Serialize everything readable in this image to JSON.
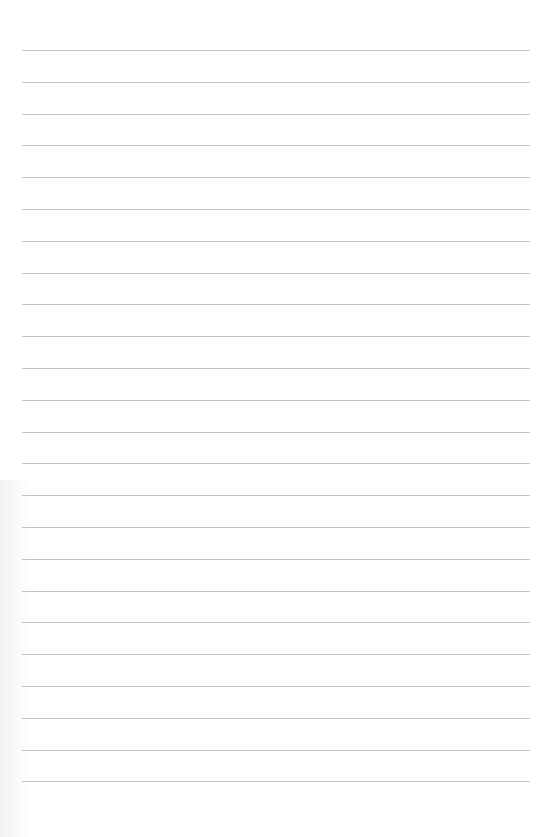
{
  "page": {
    "type": "blank lined paper",
    "line_count": 24,
    "line_color": "#c4c4c4",
    "background_color": "#ffffff",
    "first_line_y": 50,
    "line_spacing": 31.8
  }
}
